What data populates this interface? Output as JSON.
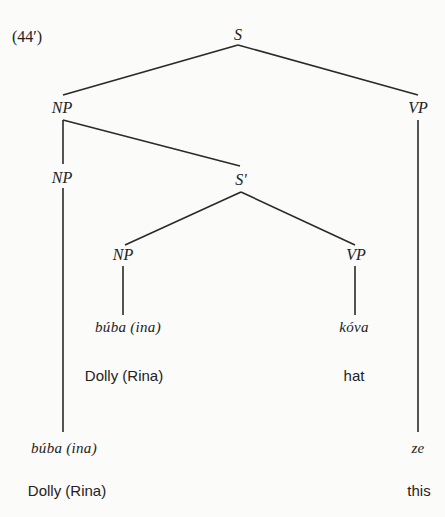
{
  "example_number": "(44′)",
  "tree": {
    "root": "S",
    "nodes": {
      "np_main": "NP",
      "vp_main": "VP",
      "np_inner": "NP",
      "s_bar": "S'",
      "np_rel": "NP",
      "vp_rel": "VP"
    },
    "words": {
      "rel_subject": "búba (ina)",
      "rel_verb": "kóva",
      "main_subject": "búba (ina)",
      "main_predicate": "ze"
    },
    "glosses": {
      "rel_subject": "Dolly (Rina)",
      "rel_verb": "hat",
      "main_subject": "Dolly (Rina)",
      "main_predicate": "this"
    }
  },
  "colors": {
    "ink": "#222222",
    "background": "#fbfbf9"
  }
}
